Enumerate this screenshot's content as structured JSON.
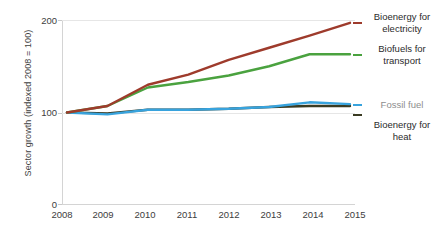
{
  "chart_data": {
    "type": "line",
    "title": "",
    "subtitle": "",
    "xlabel": "",
    "ylabel": "Sector growth (indexed 2008 = 100)",
    "x": [
      2008,
      2009,
      2010,
      2011,
      2012,
      2013,
      2014,
      2015
    ],
    "categories": [
      "2008",
      "2009",
      "2010",
      "2011",
      "2012",
      "2013",
      "2014",
      "2015"
    ],
    "xlim": [
      2008,
      2015
    ],
    "ylim": [
      0,
      200
    ],
    "yticks": [
      0,
      100,
      200
    ],
    "ytick_labels": [
      "0",
      "100",
      "200"
    ],
    "grid": false,
    "legend_position": "right-inline-end-of-line",
    "series": [
      {
        "name": "Bioenergy for electricity",
        "color": "#9e3b2c",
        "values": [
          100,
          107,
          130,
          141,
          157,
          170,
          183,
          197
        ]
      },
      {
        "name": "Biofuels for transport",
        "color": "#4aa23f",
        "values": [
          100,
          107,
          127,
          133,
          140,
          150,
          163,
          163
        ]
      },
      {
        "name": "Fossil fuel",
        "color": "#38a3dd",
        "values": [
          100,
          98,
          103,
          103,
          104,
          106,
          111,
          109
        ]
      },
      {
        "name": "Bioenergy for heat",
        "color": "#3a3b22",
        "values": [
          100,
          99,
          103,
          103,
          104,
          106,
          107,
          107
        ]
      }
    ]
  },
  "axis": {
    "y_title": "Sector growth (indexed 2008 = 100)",
    "y_ticks": [
      "200",
      "100",
      "0"
    ],
    "x_ticks": [
      "2008",
      "2009",
      "2010",
      "2011",
      "2012",
      "2013",
      "2014",
      "2015"
    ]
  },
  "labels": {
    "bioenergy_electricity_line1": "Bioenergy for",
    "bioenergy_electricity_line2": "electricity",
    "biofuels_transport_line1": "Biofuels for",
    "biofuels_transport_line2": "transport",
    "fossil_fuel": "Fossil fuel",
    "bioenergy_heat_line1": "Bioenergy for",
    "bioenergy_heat_line2": "heat"
  },
  "colors": {
    "bioenergy_electricity": "#9e3b2c",
    "biofuels_transport": "#4aa23f",
    "fossil_fuel": "#38a3dd",
    "bioenergy_heat": "#3a3b22",
    "axis_line": "#d4d4d4",
    "gridline": "#e6e6e6",
    "text": "#3f3f3f",
    "muted_text": "#8d8d8d"
  }
}
